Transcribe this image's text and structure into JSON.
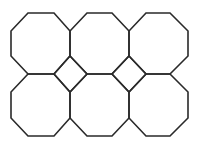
{
  "diagram": {
    "title": "",
    "stroke_color": "#2a2a2a",
    "background": "#ffffff",
    "octagons": [
      {
        "row": 0,
        "col": 0,
        "points": "28,13 54,13 70,31 70,56 54,74 28,74 11,56 11,31"
      },
      {
        "row": 0,
        "col": 1,
        "points": "87,13 112,13 129,31 129,56 112,74 87,74 70,56 70,31"
      },
      {
        "row": 0,
        "col": 2,
        "points": "146,13 170,13 188,31 188,56 170,74 146,74 129,56 129,31"
      },
      {
        "row": 1,
        "col": 0,
        "points": "28,74 54,74 70,92 70,118 54,136 28,136 11,118 11,92"
      },
      {
        "row": 1,
        "col": 1,
        "points": "87,74 112,74 129,92 129,118 112,136 87,136 70,118 70,92"
      },
      {
        "row": 1,
        "col": 2,
        "points": "146,74 170,74 188,92 188,118 170,136 146,136 129,118 129,92"
      }
    ],
    "squares": [
      {
        "points": "70,56 87,74 70,92 54,74"
      },
      {
        "points": "129,56 146,74 129,92 112,74"
      }
    ]
  }
}
